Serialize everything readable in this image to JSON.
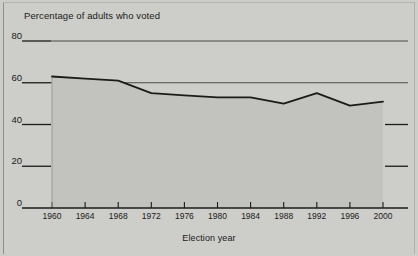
{
  "chart_data": {
    "type": "line",
    "title": "Percentage of adults who voted",
    "xlabel": "Election year",
    "ylabel": "",
    "categories": [
      "1960",
      "1964",
      "1968",
      "1972",
      "1976",
      "1980",
      "1984",
      "1988",
      "1992",
      "1996",
      "2000"
    ],
    "x": [
      1960,
      1964,
      1968,
      1972,
      1976,
      1980,
      1984,
      1988,
      1992,
      1996,
      2000
    ],
    "values": [
      63,
      62,
      61,
      55,
      54,
      53,
      53,
      50,
      55,
      49,
      51
    ],
    "series": [
      {
        "name": "Percentage of adults who voted",
        "values": [
          63,
          62,
          61,
          55,
          54,
          53,
          53,
          50,
          55,
          49,
          51
        ]
      }
    ],
    "xlim": [
      1960,
      2000
    ],
    "ylim": [
      0,
      80
    ],
    "ytick_labels": [
      "0",
      "20",
      "40",
      "60",
      "80"
    ],
    "ytick_values": [
      0,
      20,
      40,
      60,
      80
    ],
    "xtick_labels": [
      "1960",
      "1964",
      "1968",
      "1972",
      "1976",
      "1980",
      "1984",
      "1988",
      "1992",
      "1996",
      "2000"
    ],
    "grid": true,
    "gridlines_at": [
      80,
      60
    ],
    "legend": "none",
    "fill": "area-under-curve",
    "colors": {
      "background": "#cdcdc9",
      "plot_fill": "#c2c2be",
      "line": "#1b1b1b",
      "gridline": "#4a4a46",
      "axis": "#1b1b1b",
      "text": "#1b1b1b"
    }
  },
  "chart": {
    "title": "Percentage of adults who voted",
    "xaxis_title": "Election year",
    "y_ticks": [
      {
        "label": "80"
      },
      {
        "label": "60"
      },
      {
        "label": "40"
      },
      {
        "label": "20"
      },
      {
        "label": "0"
      }
    ],
    "x_ticks": [
      {
        "label": "1960"
      },
      {
        "label": "1964"
      },
      {
        "label": "1968"
      },
      {
        "label": "1972"
      },
      {
        "label": "1976"
      },
      {
        "label": "1980"
      },
      {
        "label": "1984"
      },
      {
        "label": "1988"
      },
      {
        "label": "1992"
      },
      {
        "label": "1996"
      },
      {
        "label": "2000"
      }
    ]
  }
}
